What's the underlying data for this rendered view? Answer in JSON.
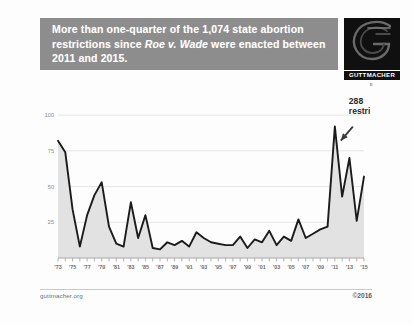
{
  "header": {
    "headline_part1": "More than one-quarter of the 1,074 state abortion restrictions since ",
    "headline_italic": "Roe v. Wade",
    "headline_part2": " were enacted between 2011 and 2015.",
    "band_color": "#8d8d8d",
    "text_color": "#ffffff"
  },
  "logo": {
    "name": "guttmacher-institute-logo",
    "wordmark": "GUTTMACHER",
    "subtext": "I N S T I T U T E",
    "background": "#101010"
  },
  "annotation": {
    "value_label": "288",
    "unit_label": "restrictions",
    "points_to_year": "'11"
  },
  "footer": {
    "site": "guttmacher.org",
    "copyright": "©2016"
  },
  "chart_data": {
    "type": "line",
    "xlabel": "",
    "ylabel": "",
    "ylim": [
      0,
      105
    ],
    "yticks": [
      25,
      50,
      75,
      100
    ],
    "grid": true,
    "legend": null,
    "area_fill": "#e2e2e2",
    "line_color": "#1b1b1b",
    "xtick_labels": [
      "'73",
      "'75",
      "'77",
      "'79",
      "'81",
      "'83",
      "'85",
      "'87",
      "'89",
      "'91",
      "'93",
      "'95",
      "'97",
      "'99",
      "'01",
      "'03",
      "'05",
      "'07",
      "'09",
      "'11",
      "'13",
      "'15"
    ],
    "x": [
      1973,
      1974,
      1975,
      1976,
      1977,
      1978,
      1979,
      1980,
      1981,
      1982,
      1983,
      1984,
      1985,
      1986,
      1987,
      1988,
      1989,
      1990,
      1991,
      1992,
      1993,
      1994,
      1995,
      1996,
      1997,
      1998,
      1999,
      2000,
      2001,
      2002,
      2003,
      2004,
      2005,
      2006,
      2007,
      2008,
      2009,
      2010,
      2011,
      2012,
      2013,
      2014,
      2015
    ],
    "values": [
      82,
      74,
      34,
      8,
      30,
      44,
      53,
      22,
      10,
      8,
      39,
      14,
      30,
      7,
      6,
      11,
      9,
      12,
      8,
      18,
      14,
      11,
      10,
      9,
      9,
      15,
      7,
      13,
      11,
      19,
      9,
      15,
      12,
      27,
      14,
      17,
      20,
      22,
      92,
      43,
      70,
      26,
      57
    ],
    "annotations": [
      {
        "x": 2011,
        "y": 92,
        "text": "288 restrictions"
      }
    ]
  }
}
